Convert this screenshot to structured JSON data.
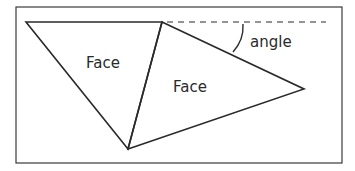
{
  "diagram": {
    "labels": {
      "face_left": "Face",
      "face_right": "Face",
      "angle": "angle"
    },
    "colors": {
      "stroke": "#2a2a2a",
      "frame": "#3a3a3a",
      "background": "#ffffff"
    }
  }
}
